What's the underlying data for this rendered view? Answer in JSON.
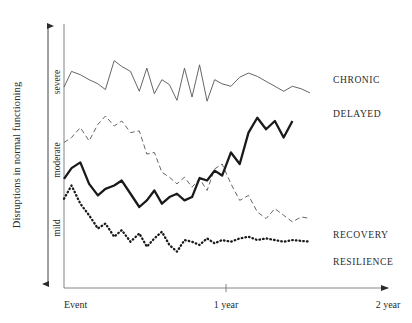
{
  "figure": {
    "background": "#ffffff",
    "ink": "#2b2b2b"
  },
  "axes": {
    "y_axis_title": "Disruptions in normal functioning",
    "y_tick_labels": [
      "severe",
      "moderate",
      "mild"
    ],
    "x_tick_labels": [
      "Event",
      "1 year",
      "2 year"
    ],
    "y_arrow_name": "double-headed-vertical-arrow",
    "x_arrow_name": "right-arrowhead"
  },
  "series_labels": {
    "chronic": "CHRONIC",
    "delayed": "DELAYED",
    "recovery": "RECOVERY",
    "resilience": "RESILIENCE"
  },
  "chart_data": {
    "type": "line",
    "title": "",
    "xlabel": "",
    "ylabel": "Disruptions in normal functioning",
    "xlim": [
      0,
      2
    ],
    "ylim": [
      0,
      3
    ],
    "xticks": [
      0,
      1,
      2
    ],
    "xtick_labels": [
      "Event",
      "1 year",
      "2 year"
    ],
    "yticks": [
      0.6,
      1.6,
      2.5
    ],
    "ytick_labels": [
      "mild",
      "moderate",
      "severe"
    ],
    "grid": false,
    "legend_position": "right-inline",
    "colors": {
      "chronic": "#555555",
      "delayed": "#1a1a1a",
      "recovery": "#666666",
      "resilience": "#1a1a1a"
    },
    "series": [
      {
        "name": "CHRONIC",
        "style": "solid-thin",
        "x": [
          0.0,
          0.06,
          0.13,
          0.2,
          0.27,
          0.33,
          0.4,
          0.46,
          0.53,
          0.6,
          0.66,
          0.72,
          0.78,
          0.84,
          0.9,
          0.96,
          1.02,
          1.08,
          1.14,
          1.2,
          1.26,
          1.33,
          1.4,
          1.47,
          1.54,
          1.61,
          1.68,
          1.75,
          1.82,
          1.89,
          1.96
        ],
        "values": [
          2.43,
          2.62,
          2.58,
          2.52,
          2.47,
          2.4,
          2.75,
          2.68,
          2.62,
          2.38,
          2.66,
          2.35,
          2.52,
          2.46,
          2.27,
          2.66,
          2.31,
          2.7,
          2.26,
          2.52,
          2.47,
          2.44,
          2.55,
          2.6,
          2.56,
          2.5,
          2.44,
          2.38,
          2.44,
          2.41,
          2.36
        ]
      },
      {
        "name": "DELAYED",
        "style": "solid-thick",
        "x": [
          0.0,
          0.06,
          0.13,
          0.2,
          0.27,
          0.33,
          0.4,
          0.46,
          0.53,
          0.6,
          0.66,
          0.72,
          0.78,
          0.84,
          0.9,
          0.96,
          1.02,
          1.08,
          1.14,
          1.2,
          1.26,
          1.33,
          1.4,
          1.47,
          1.54,
          1.61,
          1.68,
          1.75,
          1.82
        ],
        "values": [
          1.32,
          1.45,
          1.52,
          1.26,
          1.12,
          1.2,
          1.24,
          1.3,
          1.14,
          0.98,
          1.06,
          1.18,
          1.02,
          1.1,
          1.14,
          1.06,
          1.1,
          1.33,
          1.3,
          1.42,
          1.36,
          1.64,
          1.5,
          1.88,
          2.06,
          1.92,
          2.02,
          1.82,
          2.02
        ]
      },
      {
        "name": "RECOVERY",
        "style": "dashed",
        "x": [
          0.0,
          0.06,
          0.13,
          0.2,
          0.27,
          0.33,
          0.4,
          0.46,
          0.53,
          0.6,
          0.66,
          0.72,
          0.78,
          0.84,
          0.9,
          0.96,
          1.02,
          1.08,
          1.14,
          1.2,
          1.26,
          1.33,
          1.4,
          1.47,
          1.54,
          1.61,
          1.68,
          1.75,
          1.82,
          1.89,
          1.96
        ],
        "values": [
          1.76,
          1.82,
          1.94,
          1.78,
          1.98,
          2.08,
          1.96,
          2.02,
          1.88,
          1.9,
          1.62,
          1.64,
          1.4,
          1.34,
          1.26,
          1.34,
          1.22,
          1.32,
          1.18,
          1.44,
          1.5,
          1.26,
          1.06,
          1.12,
          0.92,
          0.84,
          0.96,
          0.88,
          0.8,
          0.86,
          0.84
        ]
      },
      {
        "name": "RESILIENCE",
        "style": "dotted",
        "x": [
          0.0,
          0.06,
          0.13,
          0.2,
          0.27,
          0.33,
          0.4,
          0.46,
          0.53,
          0.6,
          0.66,
          0.72,
          0.78,
          0.84,
          0.9,
          0.96,
          1.02,
          1.08,
          1.14,
          1.2,
          1.26,
          1.33,
          1.4,
          1.47,
          1.54,
          1.61,
          1.68,
          1.75,
          1.82,
          1.89,
          1.96
        ],
        "values": [
          1.08,
          1.24,
          1.02,
          0.88,
          0.72,
          0.78,
          0.62,
          0.7,
          0.56,
          0.66,
          0.5,
          0.6,
          0.68,
          0.52,
          0.44,
          0.58,
          0.56,
          0.52,
          0.6,
          0.54,
          0.58,
          0.56,
          0.6,
          0.62,
          0.58,
          0.6,
          0.58,
          0.56,
          0.58,
          0.57,
          0.56
        ]
      }
    ]
  }
}
